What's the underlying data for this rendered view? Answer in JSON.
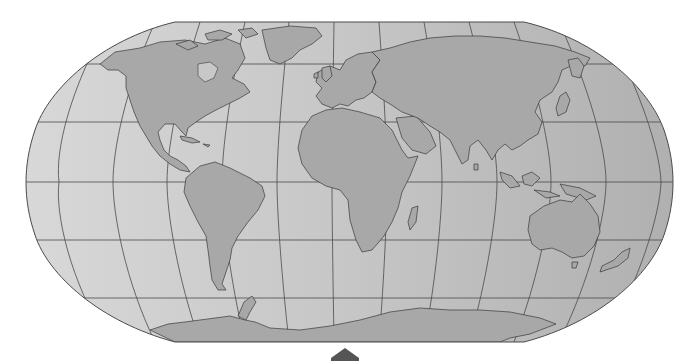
{
  "map": {
    "projection": "Robinson",
    "colors": {
      "ocean_left": "#d6d6d6",
      "ocean_right": "#b2b2b2",
      "land": "#a8a8a8",
      "coastline": "#3a3a3a",
      "graticule": "#4a4a4a",
      "background": "#ffffff",
      "nav_marker": "#555555"
    },
    "graticule": {
      "meridian_step_deg": 30,
      "parallel_step_deg": 30,
      "parallels_deg": [
        -60,
        -30,
        0,
        30,
        60
      ]
    },
    "continents": [
      "North America",
      "South America",
      "Europe",
      "Africa",
      "Asia",
      "Australia",
      "Antarctica",
      "Greenland"
    ],
    "nav_marker": {
      "icon": "up-arrow-marker",
      "direction": "up"
    }
  }
}
